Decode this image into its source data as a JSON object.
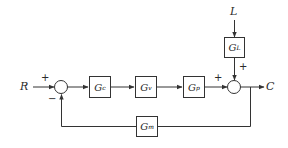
{
  "diagram": {
    "type": "feedback-control-block-diagram",
    "inputs": {
      "reference": "R",
      "load": "L"
    },
    "output": "C",
    "blocks": [
      {
        "id": "Gc",
        "symbol": "G",
        "sub": "c"
      },
      {
        "id": "Gv",
        "symbol": "G",
        "sub": "v"
      },
      {
        "id": "Gp",
        "symbol": "G",
        "sub": "p"
      },
      {
        "id": "GL",
        "symbol": "G",
        "sub": "L"
      },
      {
        "id": "Gm",
        "symbol": "G",
        "sub": "m"
      }
    ],
    "summing_junctions": [
      {
        "id": "sum1",
        "signs": {
          "R": "+",
          "feedback": "−"
        }
      },
      {
        "id": "sum2",
        "signs": {
          "Gp": "+",
          "GL": "+"
        }
      }
    ],
    "connections": [
      [
        "R",
        "sum1"
      ],
      [
        "sum1",
        "Gc"
      ],
      [
        "Gc",
        "Gv"
      ],
      [
        "Gv",
        "Gp"
      ],
      [
        "Gp",
        "sum2"
      ],
      [
        "L",
        "GL"
      ],
      [
        "GL",
        "sum2"
      ],
      [
        "sum2",
        "C"
      ],
      [
        "C",
        "Gm"
      ],
      [
        "Gm",
        "sum1"
      ]
    ],
    "colors": {
      "line": "#333333",
      "background": "#ffffff"
    }
  }
}
